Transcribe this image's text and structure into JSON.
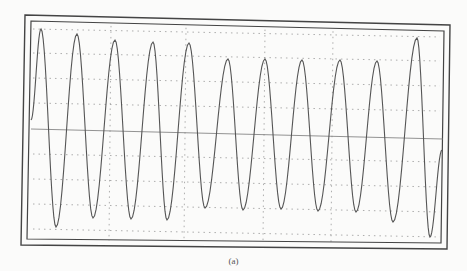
{
  "caption": "(a)",
  "chart_data": {
    "type": "line",
    "title": "",
    "xlabel": "",
    "ylabel": "",
    "grid": true,
    "grid_style": "dotted",
    "legend": "none",
    "peaks": [
      {
        "x": 41,
        "y": 29
      },
      {
        "x": 77,
        "y": 34
      },
      {
        "x": 115,
        "y": 40
      },
      {
        "x": 153,
        "y": 42
      },
      {
        "x": 189,
        "y": 43
      },
      {
        "x": 228,
        "y": 59
      },
      {
        "x": 265,
        "y": 59
      },
      {
        "x": 302,
        "y": 60
      },
      {
        "x": 340,
        "y": 60
      },
      {
        "x": 377,
        "y": 61
      },
      {
        "x": 417,
        "y": 38
      }
    ],
    "troughs": [
      {
        "x": 56,
        "y": 227
      },
      {
        "x": 93,
        "y": 218
      },
      {
        "x": 131,
        "y": 219
      },
      {
        "x": 167,
        "y": 220
      },
      {
        "x": 205,
        "y": 208
      },
      {
        "x": 243,
        "y": 210
      },
      {
        "x": 281,
        "y": 209
      },
      {
        "x": 318,
        "y": 211
      },
      {
        "x": 356,
        "y": 212
      },
      {
        "x": 393,
        "y": 222
      },
      {
        "x": 430,
        "y": 237
      }
    ],
    "start": {
      "x": 31,
      "y": 120
    },
    "end": {
      "x": 442,
      "y": 150
    },
    "baseline": {
      "x1": 31,
      "y1": 129,
      "x2": 443,
      "y2": 139
    },
    "grid_h": [
      29,
      53,
      78,
      103,
      154,
      179,
      204,
      229
    ],
    "grid_v": [
      111,
      186,
      265,
      333
    ],
    "frame_outer": {
      "x1": 25,
      "y1": 15,
      "x2": 450,
      "y2": 25,
      "x3": 447,
      "y3": 249,
      "x4": 21,
      "y4": 245
    },
    "frame_inner": {
      "x1": 31,
      "y1": 21,
      "x2": 444,
      "y2": 31,
      "x3": 441,
      "y3": 243,
      "x4": 27,
      "y4": 239
    }
  },
  "colors": {
    "trace": "#555555",
    "frame": "#444444",
    "grid": "#999999",
    "background": "#fbfbfa"
  }
}
